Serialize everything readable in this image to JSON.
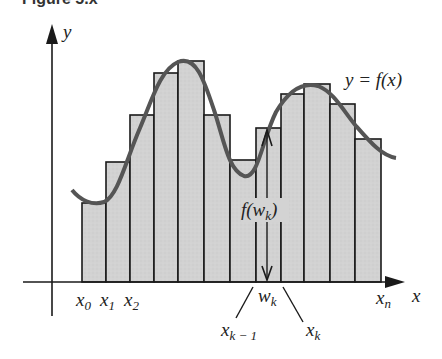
{
  "figure": {
    "title_partial": "Figure 5.x",
    "y_axis_label": "y",
    "x_axis_label": "x",
    "curve_label": "y = f(x)",
    "height_label": {
      "base": "f(w",
      "sub": "k",
      "close": ")"
    },
    "tick_labels": [
      {
        "base": "x",
        "sub": "0"
      },
      {
        "base": "x",
        "sub": "1"
      },
      {
        "base": "x",
        "sub": "2"
      },
      {
        "base": "w",
        "sub": "k"
      },
      {
        "base": "x",
        "sub": "k − 1"
      },
      {
        "base": "x",
        "sub": "k"
      },
      {
        "base": "x",
        "sub": "n"
      }
    ]
  },
  "chart_data": {
    "type": "bar",
    "xlabel": "x",
    "ylabel": "y",
    "bar_edges_px": [
      82,
      106,
      130,
      154,
      178,
      204,
      230,
      256,
      281,
      304,
      330,
      355,
      381
    ],
    "bar_tops_px": [
      203,
      162,
      115,
      73,
      61,
      115,
      160,
      128,
      94,
      84,
      104,
      139
    ],
    "axis_baseline_px": 282,
    "highlighted_bar_index": 7,
    "colors": {
      "bar_fill": "#d4d4d4",
      "bar_stroke": "#1a1a1a",
      "curve": "#555555",
      "axes": "#1a1a1a"
    }
  }
}
